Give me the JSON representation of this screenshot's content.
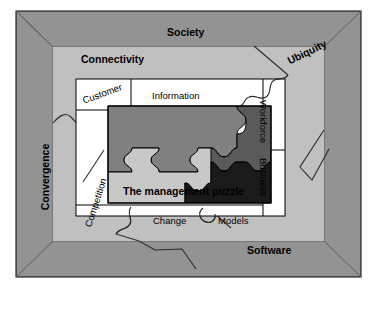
{
  "diagram": {
    "type": "nested-frame-puzzle-diagram",
    "outer_frame": {
      "name": "outer-picture-frame",
      "color": "#939393",
      "bevel_color": "#6d6d6d"
    },
    "middle_band": {
      "name": "environment-band",
      "color": "#c0c0c0",
      "labels": [
        {
          "id": "society",
          "text": "Society",
          "position": "top",
          "rotation": 0,
          "bold": true
        },
        {
          "id": "connectivity",
          "text": "Connectivity",
          "position": "top-left",
          "rotation": 0,
          "bold": true
        },
        {
          "id": "ubiquity",
          "text": "Ubiquity",
          "position": "top-right",
          "rotation": -26,
          "bold": true
        },
        {
          "id": "convergence",
          "text": "Convergence",
          "position": "left",
          "rotation": -90,
          "bold": true
        },
        {
          "id": "software",
          "text": "Software",
          "position": "bottom-right",
          "rotation": 0,
          "bold": true
        }
      ]
    },
    "inner_panel": {
      "name": "drivers-panel",
      "color": "#ffffff",
      "labels": [
        {
          "id": "customer",
          "text": "Customer",
          "position": "top-left",
          "rotation": -20,
          "bold": false
        },
        {
          "id": "information",
          "text": "Information",
          "position": "top-center",
          "rotation": 0,
          "bold": false
        },
        {
          "id": "workforce",
          "text": "Workforce",
          "position": "right-upper",
          "rotation": 90,
          "bold": false
        },
        {
          "id": "business",
          "text": "Business",
          "position": "right-lower",
          "rotation": 90,
          "bold": false
        },
        {
          "id": "competition",
          "text": "Competition",
          "position": "left",
          "rotation": -72,
          "bold": false
        },
        {
          "id": "change",
          "text": "Change",
          "position": "bottom-left",
          "rotation": 0,
          "bold": false
        },
        {
          "id": "models",
          "text": "Models",
          "position": "bottom-right",
          "rotation": 0,
          "bold": false
        }
      ]
    },
    "puzzle": {
      "name": "management-puzzle",
      "caption": "The management puzzle",
      "pieces": [
        {
          "id": "piece-upper-left",
          "color": "#808080"
        },
        {
          "id": "piece-lower-left",
          "color": "#c8c8c8"
        },
        {
          "id": "piece-right",
          "color": "#5a5a5a"
        },
        {
          "id": "piece-dark",
          "color": "#1a1a1a"
        }
      ],
      "outline_color": "#000000"
    },
    "colors": {
      "frame": "#939393",
      "frame_bevel": "#6d6d6d",
      "band": "#c0c0c0",
      "panel": "#ffffff",
      "piece_medium": "#808080",
      "piece_light": "#c8c8c8",
      "piece_dark_gray": "#5a5a5a",
      "piece_black": "#1a1a1a",
      "stroke": "#000000",
      "background": "#ffffff"
    }
  }
}
